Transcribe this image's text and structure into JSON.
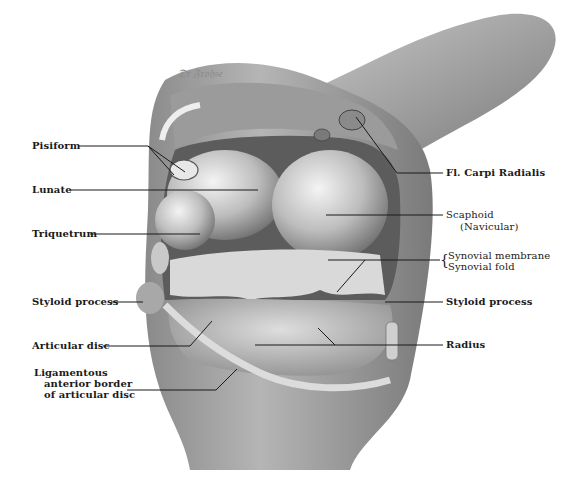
{
  "figure": {
    "signature": "Dr. Frohse",
    "labels_left": [
      {
        "id": "pisiform",
        "text": "Pisiform"
      },
      {
        "id": "lunate",
        "text": "Lunate"
      },
      {
        "id": "triquetrum",
        "text": "Triquetrum"
      },
      {
        "id": "styloid-ulna",
        "text": "Styloid process"
      },
      {
        "id": "articular-disc",
        "text": "Articular disc"
      },
      {
        "id": "lig-border-1",
        "text": "Ligamentous"
      },
      {
        "id": "lig-border-2",
        "text": "anterior border"
      },
      {
        "id": "lig-border-3",
        "text": "of articular disc"
      }
    ],
    "labels_right": [
      {
        "id": "fcr",
        "text": "Fl. Carpi Radialis"
      },
      {
        "id": "scaphoid",
        "text": "Scaphoid"
      },
      {
        "id": "navicular",
        "text": "(Navicular)"
      },
      {
        "id": "synovial-membrane",
        "text": "Synovial membrane"
      },
      {
        "id": "synovial-fold",
        "text": "Synovial fold"
      },
      {
        "id": "styloid-radius",
        "text": "Styloid process"
      },
      {
        "id": "radius",
        "text": "Radius"
      }
    ]
  }
}
